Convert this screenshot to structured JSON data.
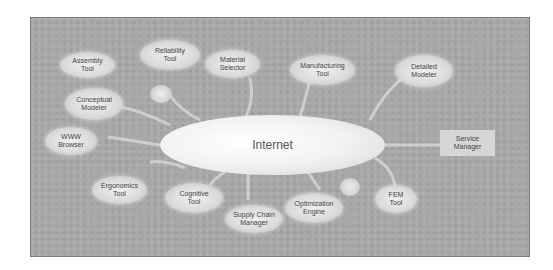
{
  "diagram": {
    "hub": {
      "label": "Internet"
    },
    "nodes": [
      {
        "id": "assembly",
        "label": "Assembly\nTool"
      },
      {
        "id": "reliability",
        "label": "Reliability\nTool"
      },
      {
        "id": "material",
        "label": "Material\nSelector"
      },
      {
        "id": "manufacturing",
        "label": "Manufacturing\nTool"
      },
      {
        "id": "detailed",
        "label": "Detailed\nModeler"
      },
      {
        "id": "conceptual",
        "label": "Conceptual\nModeler"
      },
      {
        "id": "www",
        "label": "WWW\nBrowser"
      },
      {
        "id": "service",
        "label": "Service\nManager"
      },
      {
        "id": "ergonomics",
        "label": "Ergonomics\nTool"
      },
      {
        "id": "cognitive",
        "label": "Cognitive\nTool"
      },
      {
        "id": "supply",
        "label": "Supply Chain\nManager"
      },
      {
        "id": "optimization",
        "label": "Optimization\nEngine"
      },
      {
        "id": "fem",
        "label": "FEM\nTool"
      }
    ],
    "colors": {
      "background": "#a9a9a9",
      "node_fill": "#dcdcdc",
      "hub_fill": "#f2f2f2",
      "text": "#444444"
    }
  }
}
